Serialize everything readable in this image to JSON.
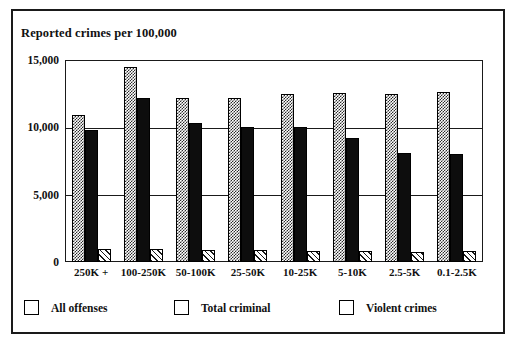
{
  "chart_data": {
    "type": "bar",
    "title": "Reported crimes per 100,000",
    "xlabel": "",
    "ylabel": "",
    "ylim": [
      0,
      15000
    ],
    "yticks": [
      0,
      5000,
      10000,
      15000
    ],
    "ytick_labels": [
      "0",
      "5,000",
      "10,000",
      "15,000"
    ],
    "grid": true,
    "legend_position": "bottom",
    "categories": [
      "250K +",
      "100-250K",
      "50-100K",
      "25-50K",
      "10-25K",
      "5-10K",
      "2.5-5K",
      "0.1-2.5K"
    ],
    "series": [
      {
        "name": "All offenses",
        "fill": "checker-gray",
        "values": [
          10900,
          14500,
          12200,
          12200,
          12500,
          12550,
          12500,
          12600
        ]
      },
      {
        "name": "Total criminal",
        "fill": "solid-black",
        "values": [
          9800,
          12200,
          10300,
          10000,
          10000,
          9200,
          8100,
          8000
        ]
      },
      {
        "name": "Violent crimes",
        "fill": "diagonal-hatch",
        "values": [
          1000,
          1000,
          900,
          900,
          850,
          850,
          750,
          850
        ]
      }
    ]
  },
  "colors": {
    "frame": "#1a1a1a",
    "axis": "#1a1a1a",
    "text": "#111111",
    "all_offenses": "#2b2b2b",
    "total_criminal": "#0d0d0d",
    "violent_crimes": "#1a1a1a",
    "background": "#ffffff"
  }
}
